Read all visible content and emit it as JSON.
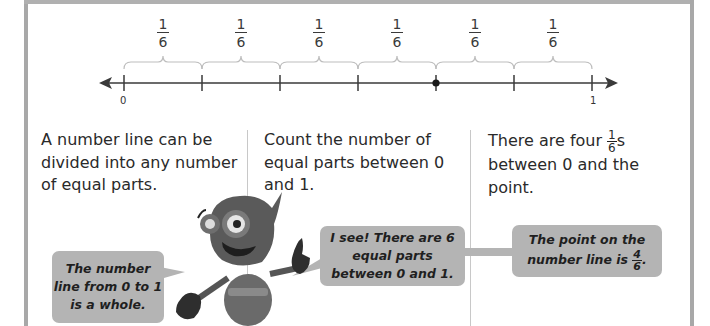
{
  "number_line": {
    "start_label": "0",
    "end_label": "1",
    "segments": [
      {
        "numerator": "1",
        "denominator": "6"
      },
      {
        "numerator": "1",
        "denominator": "6"
      },
      {
        "numerator": "1",
        "denominator": "6"
      },
      {
        "numerator": "1",
        "denominator": "6"
      },
      {
        "numerator": "1",
        "denominator": "6"
      },
      {
        "numerator": "1",
        "denominator": "6"
      }
    ],
    "point_position": "4/6"
  },
  "columns": [
    {
      "text": "A number line can be divided into any number of equal parts."
    },
    {
      "text": "Count the number of equal parts between 0 and 1."
    },
    {
      "text_before": "There are four ",
      "frac_num": "1",
      "frac_den": "6",
      "text_after": "s between 0 and the point."
    }
  ],
  "bubbles": {
    "left": "The number line from 0 to 1 is a whole.",
    "middle": "I see! There are 6 equal parts between 0 and 1.",
    "right_before": "The point on the number line is ",
    "right_frac_num": "4",
    "right_frac_den": "6",
    "right_after": "."
  },
  "colors": {
    "bubble": "#b4b4b4",
    "frame": "#a8a8a8",
    "line": "#3a3a3a",
    "brace": "#bdbdbd"
  }
}
